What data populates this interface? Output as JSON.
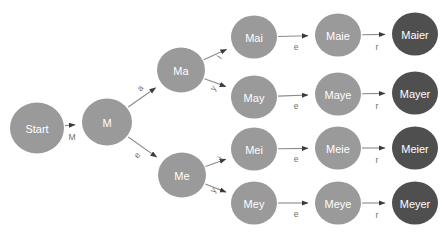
{
  "diagram": {
    "background_color": "#ffffff",
    "colors": {
      "node_default": "#9a9a9a",
      "node_terminal": "#4f4f4f",
      "node_text": "#ffffff",
      "edge": "#8a8a8a",
      "edge_label": "#6e6e6e"
    },
    "nodes": [
      {
        "id": "start",
        "label": "Start",
        "x": 37,
        "y": 128,
        "r": 27,
        "kind": "start"
      },
      {
        "id": "m",
        "label": "M",
        "x": 107,
        "y": 122,
        "r": 25,
        "kind": "default"
      },
      {
        "id": "ma",
        "label": "Ma",
        "x": 181,
        "y": 70,
        "r": 24,
        "kind": "default"
      },
      {
        "id": "me",
        "label": "Me",
        "x": 182,
        "y": 175,
        "r": 24,
        "kind": "default"
      },
      {
        "id": "mai",
        "label": "Mai",
        "x": 254,
        "y": 37,
        "r": 23,
        "kind": "default"
      },
      {
        "id": "may",
        "label": "May",
        "x": 254,
        "y": 97,
        "r": 23,
        "kind": "default"
      },
      {
        "id": "mei",
        "label": "Mei",
        "x": 254,
        "y": 149,
        "r": 23,
        "kind": "default"
      },
      {
        "id": "mey",
        "label": "Mey",
        "x": 254,
        "y": 203,
        "r": 23,
        "kind": "default"
      },
      {
        "id": "maie",
        "label": "Maie",
        "x": 338,
        "y": 35,
        "r": 23,
        "kind": "default"
      },
      {
        "id": "maye",
        "label": "Maye",
        "x": 338,
        "y": 94,
        "r": 23,
        "kind": "default"
      },
      {
        "id": "meie",
        "label": "Meie",
        "x": 338,
        "y": 148,
        "r": 23,
        "kind": "default"
      },
      {
        "id": "meye",
        "label": "Meye",
        "x": 338,
        "y": 203,
        "r": 23,
        "kind": "default"
      },
      {
        "id": "maier",
        "label": "Maier",
        "x": 415,
        "y": 34,
        "r": 23,
        "kind": "terminal"
      },
      {
        "id": "mayer",
        "label": "Mayer",
        "x": 415,
        "y": 93,
        "r": 23,
        "kind": "terminal"
      },
      {
        "id": "meier",
        "label": "Meier",
        "x": 415,
        "y": 148,
        "r": 23,
        "kind": "terminal"
      },
      {
        "id": "meyer",
        "label": "Meyer",
        "x": 415,
        "y": 203,
        "r": 23,
        "kind": "terminal"
      }
    ],
    "edges": [
      {
        "from": "start",
        "to": "m",
        "label": "M",
        "label_x": 72,
        "label_y": 137,
        "rotate": 0
      },
      {
        "from": "m",
        "to": "ma",
        "label": "a",
        "label_x": 140,
        "label_y": 88,
        "rotate": -55
      },
      {
        "from": "m",
        "to": "me",
        "label": "e",
        "label_x": 137,
        "label_y": 155,
        "rotate": -55
      },
      {
        "from": "ma",
        "to": "mai",
        "label": "i",
        "label_x": 219,
        "label_y": 57,
        "rotate": -55
      },
      {
        "from": "ma",
        "to": "may",
        "label": "y",
        "label_x": 213,
        "label_y": 88,
        "rotate": -55
      },
      {
        "from": "me",
        "to": "mei",
        "label": "i",
        "label_x": 220,
        "label_y": 158,
        "rotate": -55
      },
      {
        "from": "me",
        "to": "mey",
        "label": "y",
        "label_x": 213,
        "label_y": 190,
        "rotate": -55
      },
      {
        "from": "mai",
        "to": "maie",
        "label": "e",
        "label_x": 296,
        "label_y": 47,
        "rotate": 0
      },
      {
        "from": "may",
        "to": "maye",
        "label": "e",
        "label_x": 296,
        "label_y": 106,
        "rotate": 0
      },
      {
        "from": "mei",
        "to": "meie",
        "label": "e",
        "label_x": 296,
        "label_y": 159,
        "rotate": 0
      },
      {
        "from": "mey",
        "to": "meye",
        "label": "e",
        "label_x": 296,
        "label_y": 214,
        "rotate": 0
      },
      {
        "from": "maie",
        "to": "maier",
        "label": "r",
        "label_x": 377,
        "label_y": 47,
        "rotate": 0
      },
      {
        "from": "maye",
        "to": "mayer",
        "label": "r",
        "label_x": 377,
        "label_y": 106,
        "rotate": 0
      },
      {
        "from": "meie",
        "to": "meier",
        "label": "r",
        "label_x": 377,
        "label_y": 160,
        "rotate": 0
      },
      {
        "from": "meye",
        "to": "meyer",
        "label": "r",
        "label_x": 377,
        "label_y": 215,
        "rotate": 0
      }
    ]
  }
}
